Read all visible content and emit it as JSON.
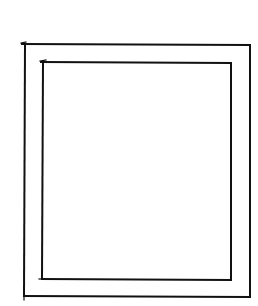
{
  "canvas": {
    "width": 258,
    "height": 306,
    "background": "#ffffff"
  },
  "stroke": {
    "color": "#111111",
    "width": 2
  },
  "shapes": {
    "outer_frame": {
      "x1": 24,
      "y1": 45,
      "x2": 250,
      "y2": 297
    },
    "inner_frame": {
      "x1": 42,
      "y1": 63,
      "x2": 231,
      "y2": 279
    }
  }
}
